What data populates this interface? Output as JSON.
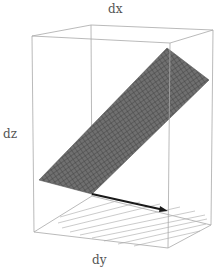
{
  "figure": {
    "type": "3d-surface-plot",
    "axis_labels": {
      "x": "dx",
      "y": "dy",
      "z": "dz"
    },
    "surface": {
      "description": "inclined tangent plane with mesh",
      "fill": "#6e6e6e",
      "mesh": "#3a3a3a"
    },
    "arrow": {
      "description": "gradient/direction vector in base plane",
      "color": "#1a1a1a"
    },
    "base_plane": {
      "description": "contour lines on floor",
      "line_color": "#b5b5b5"
    },
    "box_color": "#a8a8a8"
  }
}
